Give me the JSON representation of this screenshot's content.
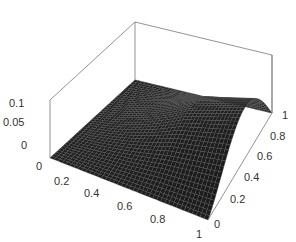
{
  "chart_data": {
    "type": "surface3d",
    "title": "",
    "xlabel": "",
    "ylabel": "",
    "zlabel": "",
    "x_ticks": [
      "0",
      "0.2",
      "0.4",
      "0.6",
      "0.8",
      "1"
    ],
    "y_ticks": [
      "0",
      "0.2",
      "0.4",
      "0.6",
      "0.8",
      "1"
    ],
    "z_ticks": [
      "0",
      "0.05",
      "0.1"
    ],
    "xlim": [
      0,
      1
    ],
    "ylim": [
      0,
      1
    ],
    "zlim": [
      0,
      0.12
    ],
    "grid": false,
    "box": true,
    "surface_color": "#1a1a1a",
    "mesh_color": "#555555",
    "box_color": "#777777"
  },
  "labels": {
    "z": [
      {
        "text": "0.1",
        "x": 9,
        "y": 98
      },
      {
        "text": "0.05",
        "x": 3,
        "y": 117
      },
      {
        "text": "0",
        "x": 21,
        "y": 140
      }
    ],
    "x": [
      {
        "text": "0",
        "x": 36,
        "y": 161
      },
      {
        "text": "0.2",
        "x": 54,
        "y": 176
      },
      {
        "text": "0.4",
        "x": 84,
        "y": 188
      },
      {
        "text": "0.6",
        "x": 117,
        "y": 201
      },
      {
        "text": "0.8",
        "x": 150,
        "y": 214
      },
      {
        "text": "1",
        "x": 196,
        "y": 229
      }
    ],
    "y": [
      {
        "text": "0",
        "x": 214,
        "y": 219
      },
      {
        "text": "0.2",
        "x": 230,
        "y": 194
      },
      {
        "text": "0.4",
        "x": 244,
        "y": 172
      },
      {
        "text": "0.6",
        "x": 257,
        "y": 151
      },
      {
        "text": "0.8",
        "x": 270,
        "y": 131
      },
      {
        "text": "1",
        "x": 282,
        "y": 110
      }
    ]
  }
}
